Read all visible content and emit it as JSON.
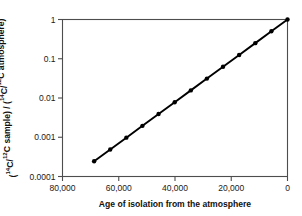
{
  "chart_data": {
    "type": "line",
    "title": "",
    "xlabel": "Age of isolation from the atmosphere",
    "ylabel": "(14C/12C sample) / (14C/12C atmosphere)",
    "ylabel_parts": {
      "open1": "(",
      "sup1": "14",
      "mid1": "C/",
      "sup2": "12",
      "mid2": "C sample) / (",
      "sup3": "14",
      "mid3": "C/",
      "sup4": "12",
      "tail": "C atmosphere)"
    },
    "xlim": [
      80000,
      0
    ],
    "x_reversed": true,
    "ylim": [
      0.0001,
      1
    ],
    "yscale": "log",
    "grid": false,
    "legend": null,
    "xticks": [
      80000,
      60000,
      40000,
      20000,
      0
    ],
    "xtick_labels": [
      "80,000",
      "60,000",
      "40,000",
      "20,000",
      "0"
    ],
    "yticks": [
      1,
      0.1,
      0.01,
      0.001,
      0.0001
    ],
    "ytick_labels": [
      "1",
      "0.1",
      "0.01",
      "0.001",
      "0.0001"
    ],
    "half_life_years": 5730,
    "marker": "filled-circle",
    "series": [
      {
        "name": "14C/12C ratio",
        "x": [
          68760,
          63030,
          57300,
          51570,
          45840,
          40110,
          34380,
          28650,
          22920,
          17190,
          11460,
          5730,
          0
        ],
        "y": [
          0.000244141,
          0.000488281,
          0.000976563,
          0.001953125,
          0.00390625,
          0.0078125,
          0.015625,
          0.03125,
          0.0625,
          0.125,
          0.25,
          0.5,
          1
        ],
        "line_color": "#000000",
        "marker_color": "#000000"
      }
    ],
    "colors": {
      "background": "#ffffff",
      "frame": "#4d4d4d",
      "line": "#000000",
      "text": "#111111"
    }
  }
}
